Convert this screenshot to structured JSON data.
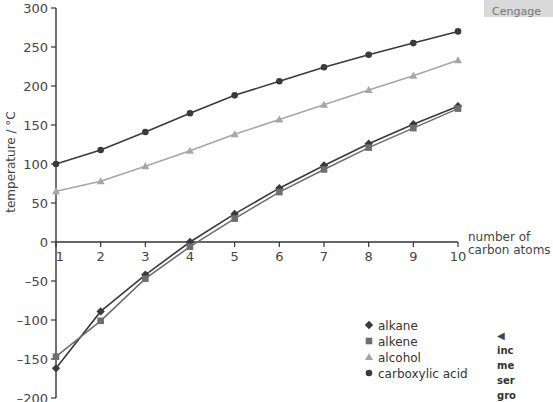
{
  "chart_data": {
    "type": "line",
    "title": "",
    "xlabel": "number of carbon atoms",
    "xlabel_lines": [
      "number of",
      "carbon atoms"
    ],
    "ylabel": "temperature / °C",
    "x": [
      1,
      2,
      3,
      4,
      5,
      6,
      7,
      8,
      9,
      10
    ],
    "xlim": [
      1,
      10
    ],
    "ylim": [
      -200,
      300
    ],
    "yticks": [
      300,
      250,
      200,
      150,
      100,
      50,
      0,
      -50,
      -100,
      -150,
      -200
    ],
    "ytick_labels": [
      "300",
      "250",
      "200",
      "150",
      "100",
      "50",
      "0",
      "–50",
      "–100",
      "–150",
      "–200"
    ],
    "xtick_labels": [
      "1",
      "2",
      "3",
      "4",
      "5",
      "6",
      "7",
      "8",
      "9",
      "10"
    ],
    "grid": false,
    "legend_position": "lower right",
    "series": [
      {
        "name": "alkane",
        "marker": "diamond",
        "color": "#3a3a3a",
        "values": [
          -162,
          -89,
          -42,
          0,
          36,
          69,
          98,
          126,
          151,
          174
        ]
      },
      {
        "name": "alkene",
        "marker": "square",
        "color": "#6e6e6e",
        "values": [
          -147,
          -101,
          -47,
          -6,
          30,
          64,
          93,
          121,
          146,
          171
        ]
      },
      {
        "name": "alcohol",
        "marker": "triangle",
        "color": "#a6a6a6",
        "values": [
          65,
          78,
          97,
          117,
          138,
          157,
          176,
          195,
          213,
          233
        ]
      },
      {
        "name": "carboxylic acid",
        "marker": "circle",
        "color": "#3a3a3a",
        "values": [
          100,
          118,
          141,
          165,
          188,
          206,
          224,
          240,
          255,
          270
        ]
      }
    ]
  },
  "legend": {
    "items": [
      {
        "label": "alkane",
        "marker": "◆"
      },
      {
        "label": "alkene",
        "marker": "■"
      },
      {
        "label": "alcohol",
        "marker": "▲"
      },
      {
        "label": "carboxylic acid",
        "marker": "●"
      }
    ]
  },
  "side_box": {
    "label": "Cengage"
  },
  "side_note": {
    "arrow": "◀",
    "lines": [
      "inc",
      "me",
      "ser",
      "gro"
    ]
  }
}
